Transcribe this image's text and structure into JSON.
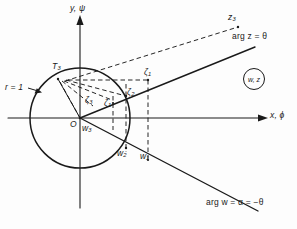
{
  "figure": {
    "background_color": "#fdfdfd",
    "ink_color": "#1a1a1a"
  },
  "axes": {
    "y_label": "y, ψ",
    "x_label": "x, ϕ",
    "origin_label": "O",
    "origin_px": [
      80,
      118
    ],
    "x_axis_y_px": 118,
    "y_axis_x_px": 80
  },
  "circle": {
    "radius_label_prefix": "r",
    "radius_label_eq": "=",
    "radius_label_value": "1",
    "radius_label": "r = 1",
    "center_px": [
      80,
      118
    ],
    "radius_px": 50
  },
  "rays": {
    "upper": {
      "label_arg": "arg",
      "label_var": "z",
      "label_eq": "=",
      "label_angle": "θ",
      "label": "arg z = θ",
      "angle_deg": 22
    },
    "lower": {
      "label_arg": "arg",
      "label_var": "w",
      "label_eq1": "=",
      "label_alpha": "α",
      "label_eq2": "=",
      "label_angle": "−θ",
      "label": "arg w = α = −θ",
      "angle_deg": -22
    }
  },
  "corner_tag": {
    "text": "w, z"
  },
  "points": [
    {
      "id": "T3",
      "base": "T",
      "sub": "3",
      "label": "T₃",
      "x": 58,
      "y": 73
    },
    {
      "id": "z3_far",
      "base": "z",
      "sub": "3",
      "label": "z₃",
      "x": 228,
      "y": 19
    },
    {
      "id": "z1_upper",
      "base": "ζ",
      "sub": "1",
      "label": "ζ₁",
      "x": 143,
      "y": 73
    },
    {
      "id": "z2",
      "base": "ζ",
      "sub": "2",
      "label": "ζ₂",
      "x": 128,
      "y": 93
    },
    {
      "id": "z1",
      "base": "ζ",
      "sub": "1",
      "label": "ζ₁",
      "x": 104,
      "y": 103
    },
    {
      "id": "z3",
      "base": "ζ",
      "sub": "3",
      "label": "ζ₃",
      "x": 86,
      "y": 100
    },
    {
      "id": "w3",
      "base": "w",
      "sub": "3",
      "label": "w₃",
      "x": 83,
      "y": 128
    },
    {
      "id": "w2",
      "base": "w",
      "sub": "2",
      "label": "w₂",
      "x": 118,
      "y": 152
    },
    {
      "id": "w1",
      "base": "w",
      "sub": "1",
      "label": "w₁",
      "x": 141,
      "y": 155
    }
  ]
}
